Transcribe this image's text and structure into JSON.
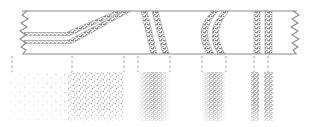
{
  "figure": {
    "width": 321,
    "height": 127,
    "background_color": "#ffffff",
    "ink_color": "#6e6e6e",
    "band_color": "#8a8a8a",
    "stipple_color": "#707070",
    "tick_color": "#8c8c8c"
  },
  "section_panel": {
    "name": "cross-section-panel",
    "left": 22,
    "right": 297,
    "top": 11,
    "bottom": 54,
    "frame_top_label": "upper contact",
    "frame_bottom_label": "lower contact",
    "break_left_label": "torn break left",
    "break_right_label": "torn break right",
    "strata_bands": [
      {
        "id": "band-1-lower",
        "label": "lower marker bed",
        "shape": "bends upward",
        "outline": "M 24,40.5 L 68,40.5 L 124,11 L 131,11 L 72,43.5 L 24,43.5 Z"
      },
      {
        "id": "band-2-upper",
        "label": "upper marker bed",
        "shape": "bends upward",
        "outline": "M 24,32.5 L 66,32.5 L 116,11 L 123,11 L 70,35.5 L 24,35.5 Z"
      },
      {
        "id": "band-3-steep-left",
        "label": "steep bed A",
        "shape": "steeply inclined",
        "outline": "M 141,11 L 147,11 L 157,54 L 151,54 Z"
      },
      {
        "id": "band-4-steep-right",
        "label": "steep bed B",
        "shape": "steeply inclined",
        "outline": "M 152,11 L 158,11 L 169,54 L 163,54 Z"
      },
      {
        "id": "band-5-bowed-left",
        "label": "bowed bed A",
        "shape": "convex-left arc",
        "outline": "M 212,11 L 218,11 C 205,26 205,38 214,54 L 207,54 C 198,38 199,26 212,11 Z"
      },
      {
        "id": "band-6-bowed-right",
        "label": "bowed bed B",
        "shape": "convex-left arc",
        "outline": "M 223,11 L 229,11 C 216,26 216,38 225,54 L 218,54 C 209,38 210,26 223,11 Z"
      },
      {
        "id": "band-7-vertical-left",
        "label": "vertical bed A",
        "shape": "vertical",
        "outline": "M 254,11 L 260,11 L 260,54 L 254,54 Z"
      },
      {
        "id": "band-8-vertical-right",
        "label": "vertical bed B",
        "shape": "vertical",
        "outline": "M 265,11 L 272,11 L 272,54 L 265,54 Z"
      }
    ]
  },
  "correlation_ticks": {
    "name": "correlation-tick-lines",
    "top": 56,
    "bottom": 72,
    "style": "dashed",
    "positions": [
      12,
      72,
      124,
      138,
      170,
      202,
      226,
      254,
      268
    ]
  },
  "profile_panel": {
    "name": "density-profile-panel",
    "left": 8,
    "right": 282,
    "top": 71,
    "bottom": 122,
    "description": "stippled intensity profile correlated to the section above",
    "zones": [
      {
        "id": "zone-sparse",
        "label": "sparse stipple",
        "x_start": 10,
        "x_end": 68,
        "density": 0.16,
        "intensity": "low"
      },
      {
        "id": "zone-medium",
        "label": "medium stipple",
        "x_start": 68,
        "x_end": 124,
        "density": 0.42,
        "intensity": "medium"
      },
      {
        "id": "zone-gap-1",
        "label": "blank gap",
        "x_start": 124,
        "x_end": 138,
        "density": 0.0,
        "intensity": "none"
      },
      {
        "id": "zone-peak-1",
        "label": "dense peak A",
        "x_start": 138,
        "x_end": 170,
        "density": 0.72,
        "intensity": "high",
        "peak_center": 153
      },
      {
        "id": "zone-gap-2",
        "label": "blank gap",
        "x_start": 170,
        "x_end": 202,
        "density": 0.0,
        "intensity": "none"
      },
      {
        "id": "zone-peak-2",
        "label": "dense peak B",
        "x_start": 202,
        "x_end": 226,
        "density": 0.7,
        "intensity": "high",
        "peak_center": 214
      },
      {
        "id": "zone-gap-3",
        "label": "blank gap",
        "x_start": 226,
        "x_end": 250,
        "density": 0.0,
        "intensity": "none"
      },
      {
        "id": "zone-bar-1",
        "label": "narrow dense bar A",
        "x_start": 251,
        "x_end": 259,
        "density": 0.66,
        "intensity": "high"
      },
      {
        "id": "zone-bar-2",
        "label": "narrow dense bar B",
        "x_start": 264,
        "x_end": 273,
        "density": 0.66,
        "intensity": "high"
      }
    ]
  }
}
